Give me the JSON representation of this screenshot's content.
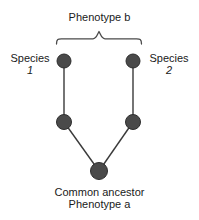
{
  "diagram": {
    "title": "Phenotype b",
    "type": "phylogenetic-tree",
    "labels": {
      "phenotype_b": "Phenotype b",
      "species_1_name": "Species",
      "species_1_number": "1",
      "species_2_name": "Species",
      "species_2_number": "2",
      "common_ancestor": "Common ancestor",
      "phenotype_a": "Phenotype a"
    },
    "colors": {
      "node_fill": "#4a4a4a",
      "node_stroke": "#2e2e2e",
      "edge": "#3a3a3a",
      "brace": "#4a4a4a",
      "background": "#ffffff",
      "text": "#1a1a1a"
    },
    "nodes": [
      {
        "id": "species-1-tip",
        "name": "species-1-node",
        "cx": 64,
        "cy": 61,
        "r": 7
      },
      {
        "id": "species-2-tip",
        "name": "species-2-node",
        "cx": 133,
        "cy": 61,
        "r": 7
      },
      {
        "id": "internal-left",
        "name": "internal-node-left",
        "cx": 64,
        "cy": 122,
        "r": 7.5
      },
      {
        "id": "internal-right",
        "name": "internal-node-right",
        "cx": 133,
        "cy": 122,
        "r": 7.5
      },
      {
        "id": "ancestor",
        "name": "common-ancestor-node",
        "cx": 99,
        "cy": 171,
        "r": 8.5
      }
    ],
    "edges": [
      {
        "name": "edge-species1-branch",
        "from": "species-1-tip",
        "to": "internal-left"
      },
      {
        "name": "edge-species2-branch",
        "from": "species-2-tip",
        "to": "internal-right"
      },
      {
        "name": "edge-ancestor-left",
        "from": "internal-left",
        "to": "ancestor"
      },
      {
        "name": "edge-ancestor-right",
        "from": "internal-right",
        "to": "ancestor"
      }
    ],
    "brace": {
      "name": "phenotype-b-brace",
      "left_x": 56,
      "right_x": 143,
      "peak_x": 99,
      "baseline_y": 39,
      "peak_y": 30
    }
  }
}
